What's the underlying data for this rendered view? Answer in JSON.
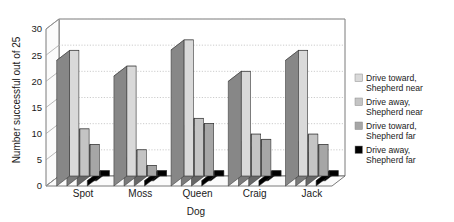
{
  "chart_data": {
    "type": "bar",
    "title": "",
    "xlabel": "Dog",
    "ylabel": "Number successful out of 25",
    "categories": [
      "Spot",
      "Moss",
      "Queen",
      "Craig",
      "Jack"
    ],
    "series": [
      {
        "name": "Drive toward, Shepherd near",
        "color": "#d9d9d9",
        "values": [
          24,
          21,
          26,
          20,
          24
        ]
      },
      {
        "name": "Drive away, Shepherd near",
        "color": "#c4c4c4",
        "values": [
          9,
          5,
          11,
          8,
          8
        ]
      },
      {
        "name": "Drive toward, Shepherd far",
        "color": "#a6a6a6",
        "values": [
          6,
          2,
          10,
          7,
          6
        ]
      },
      {
        "name": "Drive away, Shepherd far",
        "color": "#000000",
        "values": [
          1,
          1,
          1,
          1,
          1
        ]
      }
    ],
    "ylim": [
      0,
      30
    ],
    "yticks": [
      0,
      5,
      10,
      15,
      20,
      25,
      30
    ],
    "ytick_labels": [
      "0",
      "5",
      "10",
      "15",
      "20",
      "25",
      "30"
    ],
    "grid": true,
    "legend_position": "right",
    "style": "3d-clustered-column"
  },
  "legend": {
    "items": [
      {
        "label_line1": "Drive toward,",
        "label_line2": "Shepherd near",
        "color": "#d9d9d9"
      },
      {
        "label_line1": "Drive away,",
        "label_line2": "Shepherd near",
        "color": "#c4c4c4"
      },
      {
        "label_line1": "Drive toward,",
        "label_line2": "Shepherd far",
        "color": "#a6a6a6"
      },
      {
        "label_line1": "Drive away,",
        "label_line2": "Shepherd far",
        "color": "#000000"
      }
    ]
  },
  "colors": {
    "plot_background": "#ffffff",
    "grid_line": "#bfbfbf",
    "axis_line": "#4d4d4d",
    "wall_side": "#f2f2f2",
    "bar_side_shade": "#595959",
    "text": "#1a1a1a"
  }
}
